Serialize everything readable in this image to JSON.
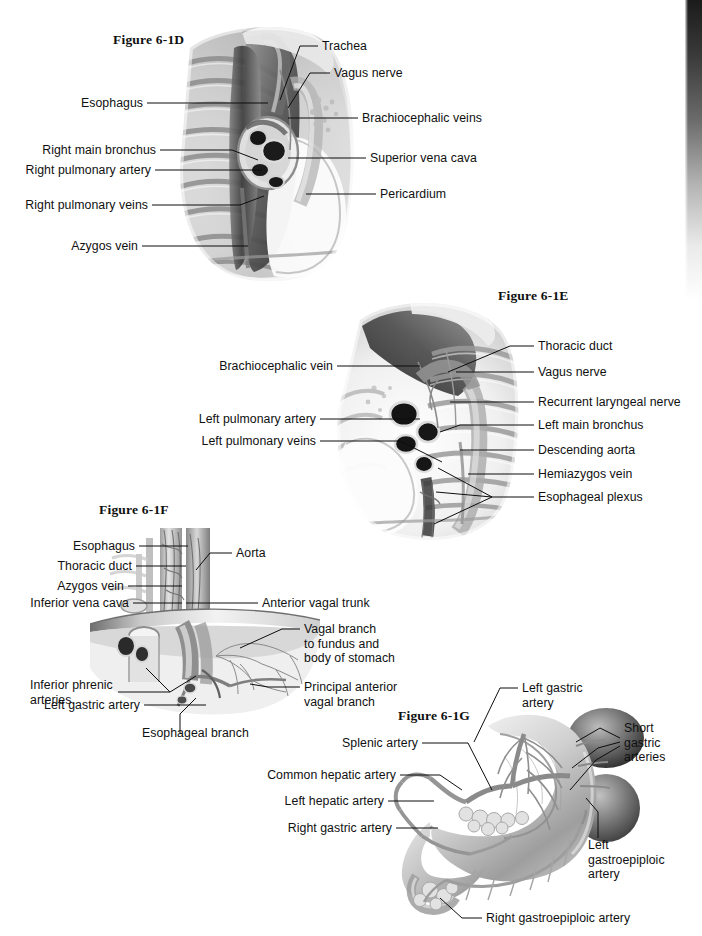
{
  "page": {
    "background_color": "#ffffff",
    "ink_color": "#101010",
    "edge_shadow_color": "#141414"
  },
  "figures": [
    {
      "id": "6-1D",
      "heading": "Figure 6-1D",
      "labels": [
        "Trachea",
        "Vagus nerve",
        "Esophagus",
        "Brachiocephalic veins",
        "Right main bronchus",
        "Right pulmonary artery",
        "Superior vena cava",
        "Right pulmonary veins",
        "Pericardium",
        "Azygos vein"
      ]
    },
    {
      "id": "6-1E",
      "heading": "Figure 6-1E",
      "labels": [
        "Thoracic duct",
        "Brachiocephalic vein",
        "Vagus nerve",
        "Recurrent laryngeal nerve",
        "Left pulmonary artery",
        "Left main bronchus",
        "Left pulmonary veins",
        "Descending aorta",
        "Hemiazygos vein",
        "Esophageal plexus"
      ]
    },
    {
      "id": "6-1F",
      "heading": "Figure 6-1F",
      "labels": [
        "Esophagus",
        "Aorta",
        "Thoracic duct",
        "Azygos vein",
        "Inferior vena cava",
        "Anterior vagal trunk",
        "Vagal branch to fundus and body of stomach",
        "Inferior phrenic arteries",
        "Principal anterior vagal branch",
        "Left gastric artery",
        "Esophageal branch"
      ]
    },
    {
      "id": "6-1G",
      "heading": "Figure 6-1G",
      "labels": [
        "Left gastric artery",
        "Short gastric arteries",
        "Splenic artery",
        "Common hepatic artery",
        "Left hepatic artery",
        "Right gastric artery",
        "Left gastroepiploic artery",
        "Right gastroepiploic artery"
      ]
    }
  ],
  "fig_d": {
    "heading": "Figure 6-1D",
    "trachea": "Trachea",
    "vagus_nerve": "Vagus nerve",
    "esophagus": "Esophagus",
    "brachiocephalic_veins": "Brachiocephalic veins",
    "right_main_bronchus": "Right main bronchus",
    "right_pulmonary_artery": "Right pulmonary artery",
    "superior_vena_cava": "Superior vena cava",
    "right_pulmonary_veins": "Right pulmonary veins",
    "pericardium": "Pericardium",
    "azygos_vein": "Azygos vein"
  },
  "fig_e": {
    "heading": "Figure 6-1E",
    "thoracic_duct": "Thoracic duct",
    "brachiocephalic_vein": "Brachiocephalic vein",
    "vagus_nerve": "Vagus nerve",
    "recurrent_laryngeal_nerve": "Recurrent laryngeal nerve",
    "left_pulmonary_artery": "Left pulmonary artery",
    "left_main_bronchus": "Left main bronchus",
    "left_pulmonary_veins": "Left pulmonary veins",
    "descending_aorta": "Descending aorta",
    "hemiazygos_vein": "Hemiazygos vein",
    "esophageal_plexus": "Esophageal plexus"
  },
  "fig_f": {
    "heading": "Figure 6-1F",
    "esophagus": "Esophagus",
    "aorta": "Aorta",
    "thoracic_duct": "Thoracic duct",
    "azygos_vein": "Azygos vein",
    "inferior_vena_cava": "Inferior vena cava",
    "anterior_vagal_trunk": "Anterior vagal trunk",
    "vagal_branch_l1": "Vagal branch",
    "vagal_branch_l2": "to fundus and",
    "vagal_branch_l3": "body of stomach",
    "inferior_phrenic_l1": "Inferior phrenic",
    "inferior_phrenic_l2": "arteries",
    "principal_anterior_l1": "Principal anterior",
    "principal_anterior_l2": "vagal branch",
    "left_gastric_artery": "Left gastric artery",
    "esophageal_branch": "Esophageal branch"
  },
  "fig_g": {
    "heading": "Figure 6-1G",
    "left_gastric_l1": "Left gastric",
    "left_gastric_l2": "artery",
    "short_gastric_l1": "Short",
    "short_gastric_l2": "gastric",
    "short_gastric_l3": "arteries",
    "splenic_artery": "Splenic artery",
    "common_hepatic_artery": "Common hepatic artery",
    "left_hepatic_artery": "Left hepatic artery",
    "right_gastric_artery": "Right gastric artery",
    "left_gastroepiploic_l1": "Left",
    "left_gastroepiploic_l2": "gastroepiploic",
    "left_gastroepiploic_l3": "artery",
    "right_gastroepiploic_artery": "Right gastroepiploic artery"
  }
}
